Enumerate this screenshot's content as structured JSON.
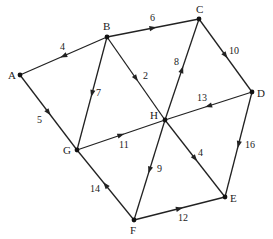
{
  "diagram": {
    "type": "directed weighted graph",
    "nodes": [
      {
        "id": "A",
        "label": "A",
        "x": 20,
        "y": 75,
        "lx": 8,
        "ly": 79
      },
      {
        "id": "B",
        "label": "B",
        "x": 107,
        "y": 37,
        "lx": 103,
        "ly": 30
      },
      {
        "id": "C",
        "label": "C",
        "x": 199,
        "y": 19,
        "lx": 196,
        "ly": 13
      },
      {
        "id": "D",
        "label": "D",
        "x": 252,
        "y": 92,
        "lx": 257,
        "ly": 97
      },
      {
        "id": "E",
        "label": "E",
        "x": 225,
        "y": 197,
        "lx": 230,
        "ly": 202
      },
      {
        "id": "F",
        "label": "F",
        "x": 134,
        "y": 220,
        "lx": 130,
        "ly": 234
      },
      {
        "id": "G",
        "label": "G",
        "x": 77,
        "y": 150,
        "lx": 63,
        "ly": 154
      },
      {
        "id": "H",
        "label": "H",
        "x": 165,
        "y": 120,
        "lx": 150,
        "ly": 119
      }
    ],
    "edges": [
      {
        "from": "B",
        "to": "A",
        "weight": "4",
        "wx": 60,
        "wy": 50
      },
      {
        "from": "A",
        "to": "G",
        "weight": "5",
        "wx": 37,
        "wy": 123
      },
      {
        "from": "B",
        "to": "C",
        "weight": "6",
        "wx": 150,
        "wy": 21
      },
      {
        "from": "B",
        "to": "G",
        "weight": "7",
        "wx": 96,
        "wy": 96
      },
      {
        "from": "B",
        "to": "H",
        "weight": "2",
        "wx": 143,
        "wy": 79
      },
      {
        "from": "H",
        "to": "C",
        "weight": "8",
        "wx": 174,
        "wy": 65
      },
      {
        "from": "C",
        "to": "D",
        "weight": "10",
        "wx": 229,
        "wy": 54
      },
      {
        "from": "D",
        "to": "H",
        "weight": "13",
        "wx": 197,
        "wy": 101
      },
      {
        "from": "G",
        "to": "H",
        "weight": "11",
        "wx": 119,
        "wy": 148
      },
      {
        "from": "H",
        "to": "F",
        "weight": "9",
        "wx": 157,
        "wy": 172
      },
      {
        "from": "H",
        "to": "E",
        "weight": "4",
        "wx": 198,
        "wy": 156
      },
      {
        "from": "D",
        "to": "E",
        "weight": "16",
        "wx": 245,
        "wy": 148
      },
      {
        "from": "F",
        "to": "E",
        "weight": "12",
        "wx": 178,
        "wy": 221
      },
      {
        "from": "F",
        "to": "G",
        "weight": "14",
        "wx": 90,
        "wy": 192
      }
    ]
  }
}
